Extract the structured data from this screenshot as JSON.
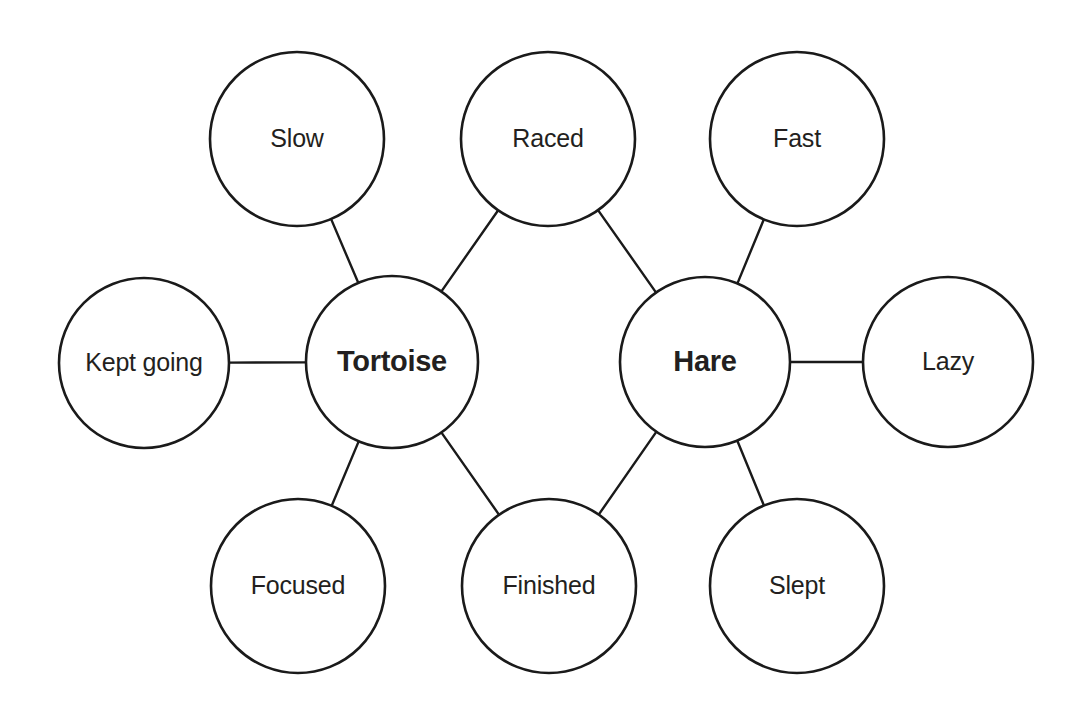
{
  "diagram": {
    "type": "concept-map",
    "background_color": "#ffffff",
    "stroke_color": "#1a1a1a",
    "text_color": "#231f20",
    "nodes": [
      {
        "id": "slow",
        "label": "Slow",
        "role": "branch",
        "cx": 297,
        "cy": 139,
        "r": 87
      },
      {
        "id": "raced",
        "label": "Raced",
        "role": "branch",
        "cx": 548,
        "cy": 139,
        "r": 87
      },
      {
        "id": "fast",
        "label": "Fast",
        "role": "branch",
        "cx": 797,
        "cy": 139,
        "r": 87
      },
      {
        "id": "kept-going",
        "label": "Kept going",
        "role": "branch",
        "cx": 144,
        "cy": 363,
        "r": 85
      },
      {
        "id": "tortoise",
        "label": "Tortoise",
        "role": "central",
        "cx": 392,
        "cy": 362,
        "r": 86
      },
      {
        "id": "hare",
        "label": "Hare",
        "role": "central",
        "cx": 705,
        "cy": 362,
        "r": 85
      },
      {
        "id": "lazy",
        "label": "Lazy",
        "role": "branch",
        "cx": 948,
        "cy": 362,
        "r": 85
      },
      {
        "id": "focused",
        "label": "Focused",
        "role": "branch",
        "cx": 298,
        "cy": 586,
        "r": 87
      },
      {
        "id": "finished",
        "label": "Finished",
        "role": "branch",
        "cx": 549,
        "cy": 586,
        "r": 87
      },
      {
        "id": "slept",
        "label": "Slept",
        "role": "branch",
        "cx": 797,
        "cy": 586,
        "r": 87
      }
    ],
    "edges": [
      {
        "id": "tortoise-slow",
        "from": "tortoise",
        "to": "slow"
      },
      {
        "id": "tortoise-raced",
        "from": "tortoise",
        "to": "raced"
      },
      {
        "id": "tortoise-kept-going",
        "from": "tortoise",
        "to": "kept-going"
      },
      {
        "id": "tortoise-focused",
        "from": "tortoise",
        "to": "focused"
      },
      {
        "id": "tortoise-finished",
        "from": "tortoise",
        "to": "finished"
      },
      {
        "id": "hare-raced",
        "from": "hare",
        "to": "raced"
      },
      {
        "id": "hare-fast",
        "from": "hare",
        "to": "fast"
      },
      {
        "id": "hare-lazy",
        "from": "hare",
        "to": "lazy"
      },
      {
        "id": "hare-finished",
        "from": "hare",
        "to": "finished"
      },
      {
        "id": "hare-slept",
        "from": "hare",
        "to": "slept"
      }
    ]
  }
}
